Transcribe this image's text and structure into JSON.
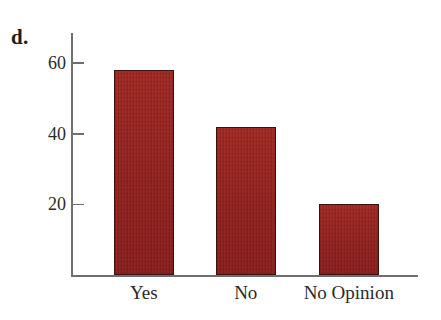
{
  "figure": {
    "part_label": "d."
  },
  "chart_data": {
    "type": "bar",
    "title": "",
    "subtitle": "",
    "xlabel": "",
    "ylabel": "",
    "categories": [
      "Yes",
      "No",
      "No Opinion"
    ],
    "values": [
      58,
      42,
      20
    ],
    "series": [
      {
        "name": "Responses",
        "values": [
          58,
          42,
          20
        ]
      }
    ],
    "ylim": [
      0,
      68
    ],
    "yticks": [
      20,
      40,
      60
    ],
    "ytick_labels": [
      "20",
      "40",
      "60"
    ],
    "grid": false,
    "legend": null,
    "legend_position": "none",
    "annotations": [],
    "bar_color": "#9e2622",
    "bar_edge_color": "#3a1210",
    "axis_color": "#6f6f70",
    "text_color": "#2a2a2a",
    "background_color": "#ffffff"
  }
}
